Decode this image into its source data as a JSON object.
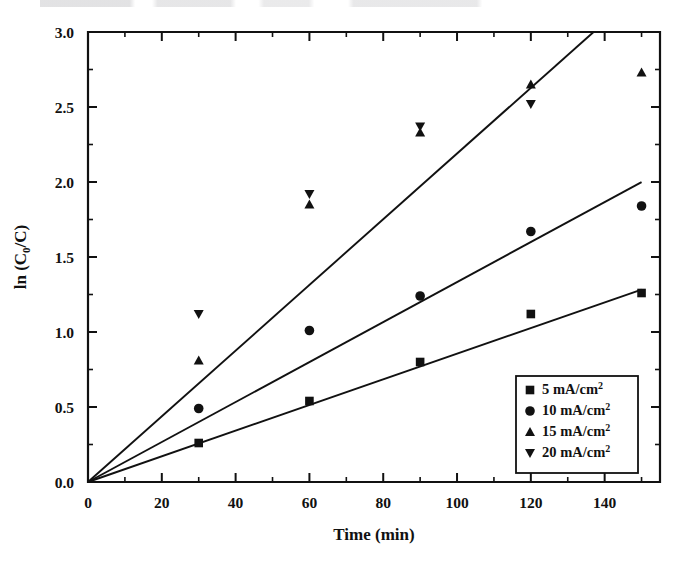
{
  "chart_data": {
    "type": "scatter",
    "title": "",
    "subtitle": "",
    "xlabel": "Time (min)",
    "ylabel": "ln (C0/C)",
    "ylabel_base": "ln (C",
    "ylabel_sub": "0",
    "ylabel_tail": "/C)",
    "xlim": [
      0,
      155
    ],
    "ylim": [
      0,
      3.0
    ],
    "xticks": [
      0,
      20,
      40,
      60,
      80,
      100,
      120,
      140
    ],
    "xtick_labels": [
      "0",
      "20",
      "40",
      "60",
      "80",
      "100",
      "120",
      "140"
    ],
    "xminor_step": 10,
    "yticks": [
      0.0,
      0.5,
      1.0,
      1.5,
      2.0,
      2.5,
      3.0
    ],
    "ytick_labels": [
      "0.0",
      "0.5",
      "1.0",
      "1.5",
      "2.0",
      "2.5",
      "3.0"
    ],
    "yminor_step": 0.25,
    "grid": false,
    "legend_position": "lower right",
    "marker_color": "#111111",
    "line_color": "#111111",
    "x": [
      30,
      60,
      90,
      120,
      150
    ],
    "series": [
      {
        "name": "5  mA/cm2",
        "label": "5  mA/cm",
        "label_sup": "2",
        "marker": "square",
        "values": [
          0.26,
          0.54,
          0.8,
          1.12,
          1.26
        ],
        "fit_slope": 0.00855,
        "fit_intercept": 0.0,
        "fit_x_end": 150
      },
      {
        "name": "10 mA/cm2",
        "label": "10 mA/cm",
        "label_sup": "2",
        "marker": "circle",
        "values": [
          0.49,
          1.01,
          1.24,
          1.67,
          1.84
        ],
        "fit_slope": 0.01333,
        "fit_intercept": 0.0,
        "fit_x_end": 150
      },
      {
        "name": "15 mA/cm2",
        "label": "15 mA/cm",
        "label_sup": "2",
        "marker": "triangle-up",
        "values": [
          0.81,
          1.85,
          2.33,
          2.65,
          2.73
        ],
        "fit_slope": 0.0219,
        "fit_intercept": 0.0,
        "fit_x_end": 137
      },
      {
        "name": "20 mA/cm2",
        "label": "20 mA/cm",
        "label_sup": "2",
        "marker": "triangle-down",
        "values": [
          1.12,
          1.92,
          2.37,
          2.52,
          null
        ],
        "fit_slope": null,
        "fit_intercept": null,
        "fit_x_end": null
      }
    ]
  },
  "legend": {
    "entries": [
      {
        "marker": "square",
        "label": "5  mA/cm",
        "sup": "2"
      },
      {
        "marker": "circle",
        "label": "10 mA/cm",
        "sup": "2"
      },
      {
        "marker": "triangle-up",
        "label": "15 mA/cm",
        "sup": "2"
      },
      {
        "marker": "triangle-down",
        "label": "20 mA/cm",
        "sup": "2"
      }
    ]
  }
}
